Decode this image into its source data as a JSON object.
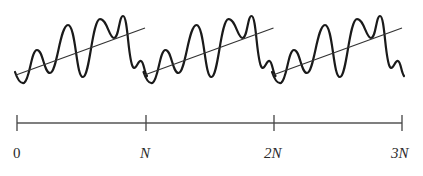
{
  "figure": {
    "periods": 3,
    "axis": {
      "ticks": [
        {
          "label": "0",
          "x": 17
        },
        {
          "label": "N",
          "x": 146
        },
        {
          "label": "2N",
          "x": 274
        },
        {
          "label": "3N",
          "x": 402
        }
      ],
      "y": 123
    },
    "colors": {
      "curve": "#1a1a1a",
      "trend": "#333333",
      "axis": "#555555"
    }
  },
  "labels": {
    "t0": "0",
    "t1": "N",
    "t2": "2N",
    "t3": "3N"
  }
}
